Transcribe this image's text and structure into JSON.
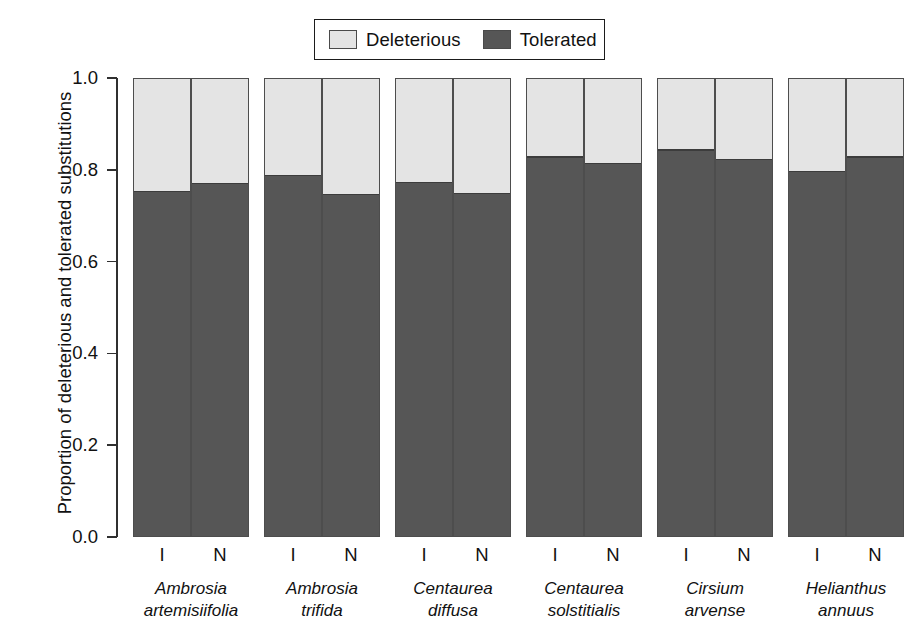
{
  "figure": {
    "ylabel": "Proportion of deleterious and tolerated substitutions",
    "legend": {
      "items": [
        {
          "label": "Deleterious",
          "color": "#e4e4e4"
        },
        {
          "label": "Tolerated",
          "color": "#565656"
        }
      ]
    },
    "yticks": [
      "0.0",
      "0.2",
      "0.4",
      "0.6",
      "0.8",
      "1.0"
    ],
    "xtick_labels": [
      "I",
      "N"
    ]
  },
  "chart_data": {
    "type": "bar",
    "title": "",
    "xlabel": "",
    "ylabel": "Proportion of deleterious and tolerated substitutions",
    "ylim": [
      0.0,
      1.0
    ],
    "yticks": [
      0.0,
      0.2,
      0.4,
      0.6,
      0.8,
      1.0
    ],
    "grid": false,
    "stacked": true,
    "legend_position": "top-center",
    "categories": [
      "Ambrosia artemisiifolia",
      "Ambrosia trifida",
      "Centaurea diffusa",
      "Centaurea solstitialis",
      "Cirsium arvense",
      "Helianthus annuus"
    ],
    "subcategories": [
      "I",
      "N"
    ],
    "series": [
      {
        "name": "Tolerated",
        "color": "#565656",
        "values": [
          {
            "category": "Ambrosia artemisiifolia",
            "I": 0.752,
            "N": 0.77
          },
          {
            "category": "Ambrosia trifida",
            "I": 0.787,
            "N": 0.746
          },
          {
            "category": "Centaurea diffusa",
            "I": 0.772,
            "N": 0.748
          },
          {
            "category": "Centaurea solstitialis",
            "I": 0.828,
            "N": 0.813
          },
          {
            "category": "Cirsium arvense",
            "I": 0.843,
            "N": 0.822
          },
          {
            "category": "Helianthus annuus",
            "I": 0.796,
            "N": 0.828
          }
        ]
      },
      {
        "name": "Deleterious",
        "color": "#e4e4e4",
        "values": [
          {
            "category": "Ambrosia artemisiifolia",
            "I": 0.248,
            "N": 0.23
          },
          {
            "category": "Ambrosia trifida",
            "I": 0.213,
            "N": 0.254
          },
          {
            "category": "Centaurea diffusa",
            "I": 0.228,
            "N": 0.252
          },
          {
            "category": "Centaurea solstitialis",
            "I": 0.172,
            "N": 0.187
          },
          {
            "category": "Cirsium arvense",
            "I": 0.157,
            "N": 0.178
          },
          {
            "category": "Helianthus annuus",
            "I": 0.204,
            "N": 0.172
          }
        ]
      }
    ]
  },
  "groups": [
    {
      "genus": "Ambrosia",
      "epithet": "artemisiifolia",
      "left": 0,
      "bars": [
        {
          "tick": "I",
          "tolerated": 0.752
        },
        {
          "tick": "N",
          "tolerated": 0.77
        }
      ]
    },
    {
      "genus": "Ambrosia",
      "epithet": "trifida",
      "left": 131,
      "bars": [
        {
          "tick": "I",
          "tolerated": 0.787
        },
        {
          "tick": "N",
          "tolerated": 0.746
        }
      ]
    },
    {
      "genus": "Centaurea",
      "epithet": "diffusa",
      "left": 262,
      "bars": [
        {
          "tick": "I",
          "tolerated": 0.772
        },
        {
          "tick": "N",
          "tolerated": 0.748
        }
      ]
    },
    {
      "genus": "Centaurea",
      "epithet": "solstitialis",
      "left": 393,
      "bars": [
        {
          "tick": "I",
          "tolerated": 0.828
        },
        {
          "tick": "N",
          "tolerated": 0.813
        }
      ]
    },
    {
      "genus": "Cirsium",
      "epithet": "arvense",
      "left": 524,
      "bars": [
        {
          "tick": "I",
          "tolerated": 0.843
        },
        {
          "tick": "N",
          "tolerated": 0.822
        }
      ]
    },
    {
      "genus": "Helianthus",
      "epithet": "annuus",
      "left": 655,
      "bars": [
        {
          "tick": "I",
          "tolerated": 0.796
        },
        {
          "tick": "N",
          "tolerated": 0.828
        }
      ]
    }
  ]
}
